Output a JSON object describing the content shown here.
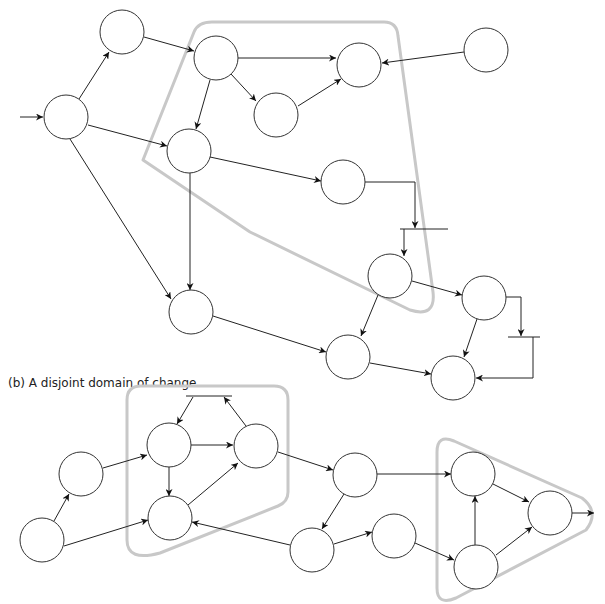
{
  "caption_b": "(b) A disjoint domain of change",
  "colors": {
    "node_stroke": "#333333",
    "edge": "#222222",
    "domain_outline": "#c8c8c8",
    "background": "#ffffff"
  },
  "part_a": {
    "nodes": [
      {
        "id": "S",
        "x": 66,
        "y": 117
      },
      {
        "id": "A",
        "x": 122,
        "y": 32
      },
      {
        "id": "B",
        "x": 216,
        "y": 58
      },
      {
        "id": "C",
        "x": 276,
        "y": 115
      },
      {
        "id": "D",
        "x": 189,
        "y": 151
      },
      {
        "id": "E",
        "x": 359,
        "y": 65
      },
      {
        "id": "F",
        "x": 486,
        "y": 50
      },
      {
        "id": "G",
        "x": 343,
        "y": 182
      },
      {
        "id": "H",
        "x": 390,
        "y": 276
      },
      {
        "id": "I",
        "x": 484,
        "y": 298
      },
      {
        "id": "J",
        "x": 453,
        "y": 378
      },
      {
        "id": "K",
        "x": 191,
        "y": 312
      },
      {
        "id": "L",
        "x": 348,
        "y": 357
      }
    ],
    "domain_outline": "M 143,160 L 194,32 Q 198,22 212,22 L 384,22 Q 397,22 398,36 L 433,292 Q 436,318 410,310 L 250,232 Z"
  },
  "part_b": {
    "nodes": [
      {
        "id": "b1",
        "x": 42,
        "y": 540
      },
      {
        "id": "b2",
        "x": 81,
        "y": 474
      },
      {
        "id": "b3",
        "x": 169,
        "y": 445
      },
      {
        "id": "b4",
        "x": 256,
        "y": 446
      },
      {
        "id": "b5",
        "x": 170,
        "y": 518
      },
      {
        "id": "b6",
        "x": 355,
        "y": 475
      },
      {
        "id": "b7",
        "x": 312,
        "y": 550
      },
      {
        "id": "b8",
        "x": 394,
        "y": 536
      },
      {
        "id": "b9",
        "x": 473,
        "y": 474
      },
      {
        "id": "b10",
        "x": 550,
        "y": 513
      },
      {
        "id": "b11",
        "x": 476,
        "y": 567
      }
    ],
    "domain_outline_1": "M 127,400 Q 127,386 141,386 L 274,386 Q 288,386 288,400 L 288,492 Q 288,502 278,506 L 160,553 Q 127,562 127,540 Z",
    "domain_outline_2": "M 437,450 Q 437,434 452,440 L 580,496 Q 597,510 585,530 Q 580,535 570,540 L 455,598 Q 437,604 437,590 Z"
  },
  "node_radius": 22
}
